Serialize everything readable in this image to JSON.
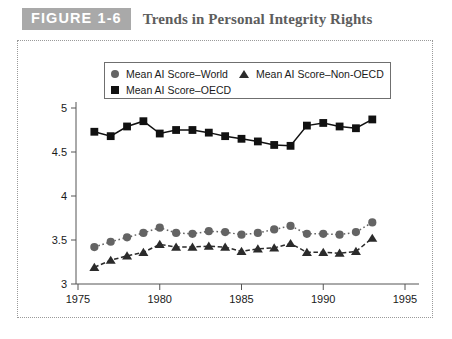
{
  "header": {
    "badge": "FIGURE 1-6",
    "title": "Trends in Personal Integrity Rights"
  },
  "legend": {
    "position": "top-center",
    "entries": [
      {
        "label": "Mean AI Score–World",
        "marker": "circle-marker",
        "color": "#646464"
      },
      {
        "label": "Mean AI Score–Non-OECD",
        "marker": "triangle-marker",
        "color": "#2b2b2b"
      },
      {
        "label": "Mean AI Score–OECD",
        "marker": "square-marker",
        "color": "#111111"
      }
    ]
  },
  "axes": {
    "x_ticks": [
      "1975",
      "1980",
      "1985",
      "1990",
      "1995"
    ],
    "y_ticks": [
      "3",
      "3.5",
      "4",
      "4.5",
      "5"
    ]
  },
  "chart_data": {
    "type": "line",
    "title": "Trends in Personal Integrity Rights",
    "xlabel": "",
    "ylabel": "",
    "xlim": [
      1975,
      1995
    ],
    "ylim": [
      3,
      5
    ],
    "grid": false,
    "legend_position": "top-center",
    "x": [
      1976,
      1977,
      1978,
      1979,
      1980,
      1981,
      1982,
      1983,
      1984,
      1985,
      1986,
      1987,
      1988,
      1989,
      1990,
      1991,
      1992,
      1993
    ],
    "series": [
      {
        "name": "Mean AI Score–OECD",
        "marker": "square",
        "color": "#111111",
        "linestyle": "solid",
        "values": [
          4.73,
          4.68,
          4.79,
          4.85,
          4.71,
          4.75,
          4.75,
          4.72,
          4.68,
          4.65,
          4.62,
          4.58,
          4.57,
          4.8,
          4.83,
          4.79,
          4.77,
          4.87
        ]
      },
      {
        "name": "Mean AI Score–World",
        "marker": "circle",
        "color": "#646464",
        "linestyle": "dotted",
        "values": [
          3.42,
          3.48,
          3.53,
          3.58,
          3.64,
          3.58,
          3.57,
          3.6,
          3.59,
          3.56,
          3.58,
          3.62,
          3.66,
          3.57,
          3.57,
          3.56,
          3.59,
          3.7
        ]
      },
      {
        "name": "Mean AI Score–Non-OECD",
        "marker": "triangle",
        "color": "#2b2b2b",
        "linestyle": "dashed",
        "values": [
          3.19,
          3.27,
          3.32,
          3.36,
          3.45,
          3.42,
          3.42,
          3.43,
          3.42,
          3.37,
          3.4,
          3.41,
          3.46,
          3.36,
          3.36,
          3.35,
          3.37,
          3.52
        ]
      }
    ]
  }
}
